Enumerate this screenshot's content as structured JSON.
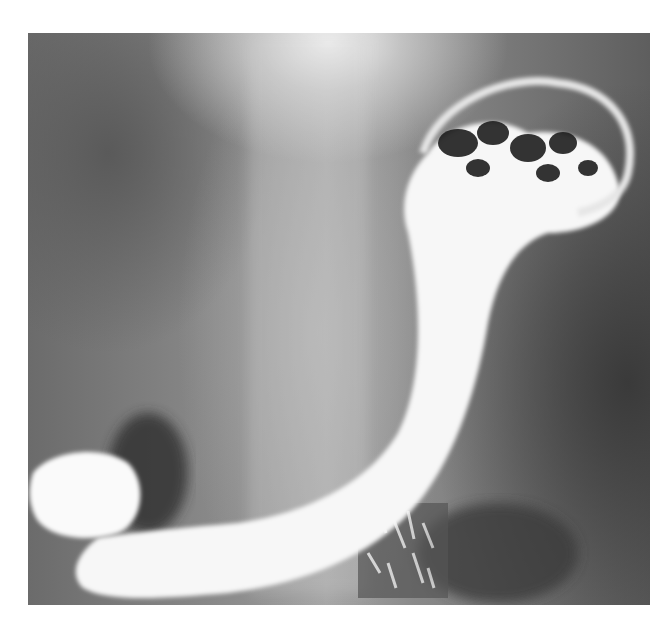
{
  "image": {
    "description": "Barium contrast radiograph of stomach showing J-shaped barium-filled stomach with irregular mottled fundus at upper right and duodenal bulb at lower left",
    "colors": {
      "background": "#ffffff",
      "barium": "#f7f7f7",
      "soft_tissue": "#8a8a8a",
      "dark_gas": "#2a2a2a"
    }
  }
}
